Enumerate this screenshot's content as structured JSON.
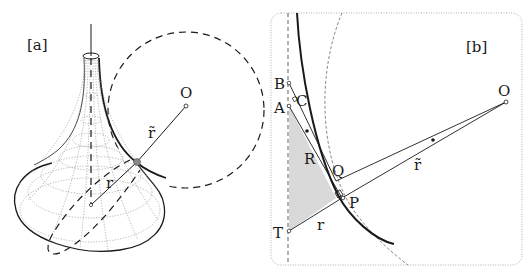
{
  "panel_a": {
    "label": "[a]",
    "points": {
      "O": "O"
    },
    "segments": {
      "r": "r",
      "r_tilde": "r̃"
    },
    "description": "Pseudosphere surface with dashed osculating circle centered at O"
  },
  "panel_b": {
    "label": "[b]",
    "points": {
      "B": "B",
      "A": "A",
      "C": "C",
      "Q": "Q",
      "P": "P",
      "T": "T",
      "O": "O"
    },
    "segments": {
      "R": "R",
      "r": "r",
      "r_tilde": "r̃"
    },
    "description": "Tractrix cross-section with tangent construction and shaded triangle"
  },
  "colors": {
    "stroke": "#1a1a1a",
    "shade": "#d9d9d9",
    "frame": "#9a9a9a",
    "grid": "#8a8a8a"
  }
}
